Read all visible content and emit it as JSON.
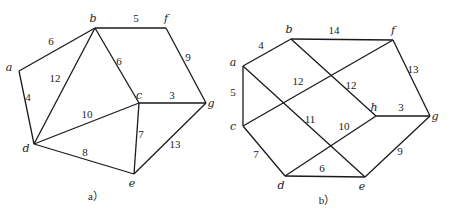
{
  "graphs": [
    {
      "id": "a",
      "caption": "a）",
      "caption_pos": [
        96,
        200
      ],
      "vertices": [
        {
          "name": "a",
          "x": 19,
          "y": 71,
          "lx": -10,
          "ly": 0
        },
        {
          "name": "b",
          "x": 95,
          "y": 28,
          "lx": -2,
          "ly": -6
        },
        {
          "name": "f",
          "x": 166,
          "y": 28,
          "lx": 0,
          "ly": -6
        },
        {
          "name": "c",
          "x": 139,
          "y": 103,
          "lx": 0,
          "ly": -4
        },
        {
          "name": "g",
          "x": 206,
          "y": 103,
          "lx": 5,
          "ly": 4
        },
        {
          "name": "d",
          "x": 34,
          "y": 144,
          "lx": -8,
          "ly": 8
        },
        {
          "name": "e",
          "x": 134,
          "y": 174,
          "lx": -2,
          "ly": 13
        }
      ],
      "edges": [
        {
          "from": "a",
          "to": "b",
          "weight": "6",
          "lx": 51,
          "ly": 45
        },
        {
          "from": "b",
          "to": "f",
          "weight": "5",
          "lx": 136,
          "ly": 22
        },
        {
          "from": "b",
          "to": "d",
          "weight": "12",
          "lx": 55,
          "ly": 82
        },
        {
          "from": "b",
          "to": "c",
          "weight": "6",
          "lx": 119,
          "ly": 65
        },
        {
          "from": "f",
          "to": "g",
          "weight": "9",
          "lx": 188,
          "ly": 61
        },
        {
          "from": "c",
          "to": "g",
          "weight": "3",
          "lx": 172,
          "ly": 99
        },
        {
          "from": "a",
          "to": "d",
          "weight": "4",
          "lx": 28,
          "ly": 101
        },
        {
          "from": "d",
          "to": "c",
          "weight": "10",
          "lx": 87,
          "ly": 118
        },
        {
          "from": "c",
          "to": "e",
          "weight": "7",
          "lx": 141,
          "ly": 138
        },
        {
          "from": "d",
          "to": "e",
          "weight": "8",
          "lx": 85,
          "ly": 156
        },
        {
          "from": "e",
          "to": "g",
          "weight": "13",
          "lx": 175,
          "ly": 148
        }
      ]
    },
    {
      "id": "b",
      "caption": "b）",
      "caption_pos": [
        327,
        204
      ],
      "vertices": [
        {
          "name": "a",
          "x": 243,
          "y": 66,
          "lx": -10,
          "ly": 0
        },
        {
          "name": "b",
          "x": 291,
          "y": 39,
          "lx": -2,
          "ly": -6
        },
        {
          "name": "f",
          "x": 393,
          "y": 40,
          "lx": 0,
          "ly": -6
        },
        {
          "name": "c",
          "x": 243,
          "y": 126,
          "lx": -10,
          "ly": 4
        },
        {
          "name": "h",
          "x": 376,
          "y": 116,
          "lx": -2,
          "ly": -5
        },
        {
          "name": "g",
          "x": 430,
          "y": 116,
          "lx": 5,
          "ly": 4
        },
        {
          "name": "d",
          "x": 285,
          "y": 176,
          "lx": -4,
          "ly": 13
        },
        {
          "name": "e",
          "x": 365,
          "y": 177,
          "lx": -3,
          "ly": 13
        }
      ],
      "edges": [
        {
          "from": "a",
          "to": "b",
          "weight": "4",
          "lx": 261,
          "ly": 49
        },
        {
          "from": "b",
          "to": "f",
          "weight": "14",
          "lx": 334,
          "ly": 34
        },
        {
          "from": "f",
          "to": "g",
          "weight": "13",
          "lx": 413,
          "ly": 73
        },
        {
          "from": "a",
          "to": "c",
          "weight": "5",
          "lx": 233,
          "ly": 96
        },
        {
          "from": "c",
          "to": "f",
          "weight": "12",
          "lx": 298,
          "ly": 85
        },
        {
          "from": "b",
          "to": "h",
          "weight": "12",
          "lx": 351,
          "ly": 89
        },
        {
          "from": "h",
          "to": "g",
          "weight": "3",
          "lx": 401,
          "ly": 111
        },
        {
          "from": "a",
          "to": "e",
          "weight": "11",
          "lx": 310,
          "ly": 123
        },
        {
          "from": "d",
          "to": "h",
          "weight": "10",
          "lx": 344,
          "ly": 130
        },
        {
          "from": "c",
          "to": "d",
          "weight": "7",
          "lx": 256,
          "ly": 158
        },
        {
          "from": "d",
          "to": "e",
          "weight": "6",
          "lx": 322,
          "ly": 172
        },
        {
          "from": "e",
          "to": "g",
          "weight": "9",
          "lx": 400,
          "ly": 155
        }
      ]
    }
  ],
  "bottom_cutoff_text": "图…"
}
